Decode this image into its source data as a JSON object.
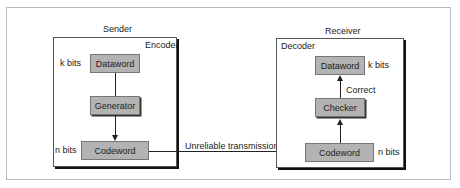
{
  "diagram": {
    "sender": {
      "title": "Sender",
      "panel_label": "Encoder",
      "dataword": {
        "label": "Dataword",
        "size_label": "k bits"
      },
      "generator": {
        "label": "Generator"
      },
      "codeword": {
        "label": "Codeword",
        "size_label": "n bits"
      }
    },
    "channel": {
      "label": "Unreliable transmission"
    },
    "receiver": {
      "title": "Receiver",
      "panel_label": "Decoder",
      "dataword": {
        "label": "Dataword",
        "size_label": "k bits"
      },
      "checker": {
        "label": "Checker",
        "edge_label": "Correct"
      },
      "codeword": {
        "label": "Codeword",
        "size_label": "n bits"
      }
    },
    "colors": {
      "node_fill": "#b3b3b3",
      "frame_border": "#b8b8b8",
      "line": "#222222"
    }
  }
}
